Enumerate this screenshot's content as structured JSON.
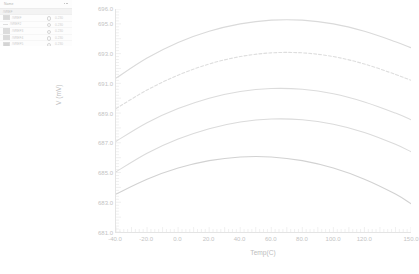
{
  "legend": {
    "header_label": "Name",
    "menu_icon": "kebab-menu-icon",
    "group_label": "/VREF",
    "traces": [
      {
        "name": "/VREF",
        "swatch_style": "solid",
        "color": "#d9d9d9",
        "marker": "circle",
        "value": "0.230"
      },
      {
        "name": "/VREF2",
        "swatch_style": "dashed",
        "color": "#dedede",
        "marker": "circle",
        "value": "0.230"
      },
      {
        "name": "/VREF3",
        "swatch_style": "solid",
        "color": "#dcdcdc",
        "marker": "circle",
        "value": "0.230"
      },
      {
        "name": "/VREF4",
        "swatch_style": "solid",
        "color": "#dbdbdb",
        "marker": "circle",
        "value": "0.230"
      },
      {
        "name": "/VREF5",
        "swatch_style": "solid",
        "color": "#d4d4d4",
        "marker": "circle",
        "value": "0.230"
      }
    ]
  },
  "chart_data": {
    "type": "line",
    "title": "",
    "xlabel": "Temp(C)",
    "ylabel": "V (mV)",
    "xlim": [
      -40.0,
      150.0
    ],
    "ylim": [
      681.0,
      696.0
    ],
    "grid": false,
    "legend_position": "external-top-left",
    "xticks": [
      -40.0,
      -20.0,
      0.0,
      20.0,
      40.0,
      60.0,
      80.0,
      100.0,
      120.0,
      150.0
    ],
    "xtick_labels": [
      "-40.0",
      "-20.0",
      "0.0",
      "20.0",
      "40.0",
      "60.0",
      "80.0",
      "100.0",
      "120.0",
      "150.0"
    ],
    "yticks": [
      681.0,
      683.0,
      685.0,
      687.0,
      689.0,
      691.0,
      693.0,
      695.0,
      696.0
    ],
    "ytick_labels": [
      "681.0",
      "683.0",
      "685.0",
      "687.0",
      "689.0",
      "691.0",
      "693.0",
      "695.0",
      "696.0"
    ],
    "x": [
      -40,
      -20,
      0,
      20,
      40,
      60,
      80,
      100,
      120,
      140,
      150
    ],
    "series": [
      {
        "name": "/VREF",
        "color": "#dadada",
        "dash": false,
        "values": [
          691.35,
          692.7,
          693.75,
          694.5,
          695.0,
          695.25,
          695.25,
          695.0,
          694.5,
          693.8,
          693.4
        ]
      },
      {
        "name": "/VREF2",
        "color": "#dedede",
        "dash": true,
        "values": [
          689.3,
          690.55,
          691.55,
          692.3,
          692.8,
          693.05,
          693.05,
          692.8,
          692.3,
          691.6,
          691.2
        ]
      },
      {
        "name": "/VREF3",
        "color": "#dcdcdc",
        "dash": false,
        "values": [
          687.1,
          688.35,
          689.3,
          690.0,
          690.45,
          690.65,
          690.6,
          690.3,
          689.75,
          689.0,
          688.55
        ]
      },
      {
        "name": "/VREF4",
        "color": "#dbdbdb",
        "dash": false,
        "values": [
          685.05,
          686.3,
          687.25,
          687.95,
          688.4,
          688.6,
          688.55,
          688.25,
          687.7,
          686.9,
          686.4
        ]
      },
      {
        "name": "/VREF5",
        "color": "#d2d2d2",
        "dash": false,
        "values": [
          683.55,
          684.55,
          685.3,
          685.8,
          686.05,
          686.05,
          685.8,
          685.3,
          684.55,
          683.55,
          682.9
        ]
      }
    ]
  }
}
